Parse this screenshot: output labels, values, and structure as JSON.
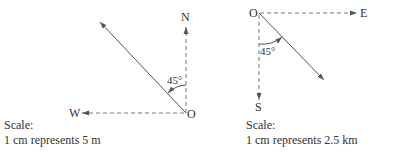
{
  "diagrams": [
    {
      "north_label": "N",
      "west_label": "W",
      "origin_label": "O",
      "angle_label": "45°",
      "scale_title": "Scale:",
      "scale_text": "1 cm represents 5 m"
    },
    {
      "east_label": "E",
      "south_label": "S",
      "origin_label": "O",
      "angle_label": "45°",
      "scale_title": "Scale:",
      "scale_text": "1 cm represents 2.5 km"
    }
  ],
  "colors": {
    "line": "#555555",
    "text": "#333333"
  }
}
